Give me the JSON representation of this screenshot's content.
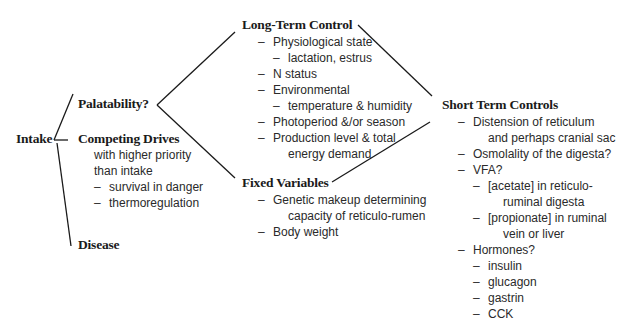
{
  "root": {
    "label": "Intake"
  },
  "branches": {
    "palatability": {
      "label": "Palatability?"
    },
    "competing_drives": {
      "label": "Competing Drives",
      "lines": [
        {
          "indent": 0,
          "dash": false,
          "text": "with higher priority"
        },
        {
          "indent": 0,
          "dash": false,
          "text": "than intake"
        },
        {
          "indent": 0,
          "dash": true,
          "text": "survival in danger"
        },
        {
          "indent": 0,
          "dash": true,
          "text": "thermoregulation"
        }
      ]
    },
    "disease": {
      "label": "Disease"
    }
  },
  "long_term_control": {
    "label": "Long-Term Control",
    "lines": [
      {
        "indent": 0,
        "dash": true,
        "text": "Physiological state"
      },
      {
        "indent": 1,
        "dash": true,
        "text": "lactation, estrus"
      },
      {
        "indent": 0,
        "dash": true,
        "text": "N status"
      },
      {
        "indent": 0,
        "dash": true,
        "text": "Environmental"
      },
      {
        "indent": 1,
        "dash": true,
        "text": "temperature & humidity"
      },
      {
        "indent": 0,
        "dash": true,
        "text": "Photoperiod &/or season"
      },
      {
        "indent": 0,
        "dash": true,
        "text": "Production level & total"
      },
      {
        "indent": 1,
        "dash": false,
        "text": "energy demand"
      }
    ]
  },
  "fixed_variables": {
    "label": "Fixed Variables",
    "lines": [
      {
        "indent": 0,
        "dash": true,
        "text": "Genetic makeup determining"
      },
      {
        "indent": 1,
        "dash": false,
        "text": "capacity of reticulo-rumen"
      },
      {
        "indent": 0,
        "dash": true,
        "text": "Body weight"
      }
    ]
  },
  "short_term_controls": {
    "label": "Short Term Controls",
    "lines": [
      {
        "indent": 0,
        "dash": true,
        "text": "Distension of reticulum"
      },
      {
        "indent": 1,
        "dash": false,
        "text": "and perhaps cranial sac"
      },
      {
        "indent": 0,
        "dash": true,
        "text": "Osmolality of the digesta?"
      },
      {
        "indent": 0,
        "dash": true,
        "text": "VFA?"
      },
      {
        "indent": 1,
        "dash": true,
        "text": "[acetate] in reticulo-"
      },
      {
        "indent": 2,
        "dash": false,
        "text": "ruminal digesta"
      },
      {
        "indent": 1,
        "dash": true,
        "text": "[propionate] in ruminal"
      },
      {
        "indent": 2,
        "dash": false,
        "text": "vein or liver"
      },
      {
        "indent": 0,
        "dash": true,
        "text": "Hormones?"
      },
      {
        "indent": 1,
        "dash": true,
        "text": "insulin"
      },
      {
        "indent": 1,
        "dash": true,
        "text": "glucagon"
      },
      {
        "indent": 1,
        "dash": true,
        "text": "gastrin"
      },
      {
        "indent": 1,
        "dash": true,
        "text": "CCK"
      }
    ]
  },
  "dash_glyph": "–"
}
